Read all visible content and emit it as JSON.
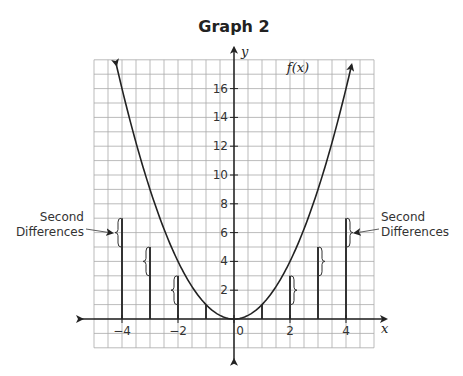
{
  "header_fragment": "by (using technology)",
  "chart_data": {
    "type": "line",
    "title": "Graph 2",
    "xlabel": "x",
    "ylabel": "y",
    "function_label": "f(x)",
    "function": "f(x) = x^2",
    "xlim": [
      -5,
      5
    ],
    "ylim": [
      -2,
      18
    ],
    "grid": true,
    "x_ticks": [
      -4,
      -2,
      0,
      2,
      4
    ],
    "x_tick_labels": [
      "−4",
      "−2",
      "0",
      "2",
      "4"
    ],
    "y_ticks": [
      2,
      4,
      6,
      8,
      10,
      12,
      14,
      16
    ],
    "y_tick_labels": [
      "2",
      "4",
      "6",
      "8",
      "10",
      "12",
      "14",
      "16"
    ],
    "curve_points": [
      {
        "x": -4.2,
        "y": 17.64
      },
      {
        "x": -4,
        "y": 16
      },
      {
        "x": -3,
        "y": 9
      },
      {
        "x": -2,
        "y": 4
      },
      {
        "x": -1,
        "y": 1
      },
      {
        "x": 0,
        "y": 0
      },
      {
        "x": 1,
        "y": 1
      },
      {
        "x": 2,
        "y": 4
      },
      {
        "x": 3,
        "y": 9
      },
      {
        "x": 4,
        "y": 16
      },
      {
        "x": 4.2,
        "y": 17.64
      }
    ],
    "bars": [
      {
        "x": -4,
        "height": 7
      },
      {
        "x": -3,
        "height": 5
      },
      {
        "x": -2,
        "height": 3
      },
      {
        "x": -1,
        "height": 1
      },
      {
        "x": 1,
        "height": 1
      },
      {
        "x": 2,
        "height": 3
      },
      {
        "x": 3,
        "height": 5
      },
      {
        "x": 4,
        "height": 7
      }
    ],
    "brackets": [
      {
        "x": -4,
        "from": 5,
        "to": 7,
        "side": "left"
      },
      {
        "x": -3,
        "from": 3,
        "to": 5,
        "side": "left"
      },
      {
        "x": -2,
        "from": 1,
        "to": 3,
        "side": "left"
      },
      {
        "x": 2,
        "from": 1,
        "to": 3,
        "side": "right"
      },
      {
        "x": 3,
        "from": 3,
        "to": 5,
        "side": "right"
      },
      {
        "x": 4,
        "from": 5,
        "to": 7,
        "side": "right"
      }
    ],
    "annotations": [
      {
        "text_line1": "Second",
        "text_line2": "Differences",
        "side": "left"
      },
      {
        "text_line1": "Second",
        "text_line2": "Differences",
        "side": "right"
      }
    ]
  }
}
